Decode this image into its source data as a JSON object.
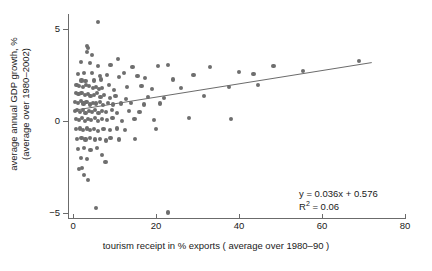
{
  "chart_data": {
    "type": "scatter",
    "title": "",
    "xlabel": "tourism receipt in % exports ( average over 1980–90 )",
    "ylabel_line1": "average annual GDP growth, %",
    "ylabel_line2": "(average over 1980–2002)",
    "xlim": [
      -1,
      80.5
    ],
    "ylim": [
      -5.9,
      5.8
    ],
    "xticks": [
      0,
      20,
      40,
      60,
      80
    ],
    "xtick_labels": [
      "0",
      "20",
      "40",
      "60",
      "80"
    ],
    "yticks": [
      5,
      0,
      -5
    ],
    "ytick_labels": [
      "5",
      "0",
      "−5"
    ],
    "grid": false,
    "legend": null,
    "marker_color": "#6e6e6e",
    "marker_size": 4.2,
    "axis_color": "#6b6b6b",
    "trendline": {
      "equation": "y = 0.036x + 0.576",
      "slope": 0.036,
      "intercept": 0.576,
      "r_squared": "R² = 0.06",
      "r_squared_value": 0.06,
      "color": "#6b6b6b",
      "x_start": 0.3,
      "x_end": 72.0
    },
    "annotation_lines": [
      "y = 0.036x + 0.576",
      "R2 = 0.06"
    ],
    "points": [
      [
        6.0,
        5.35
      ],
      [
        3.3,
        4.05
      ],
      [
        3.6,
        3.95
      ],
      [
        3.4,
        3.75
      ],
      [
        4.6,
        3.6
      ],
      [
        1.9,
        3.2
      ],
      [
        4.0,
        3.15
      ],
      [
        6.0,
        3.0
      ],
      [
        9.0,
        3.05
      ],
      [
        10.8,
        3.35
      ],
      [
        14.3,
        2.95
      ],
      [
        20.5,
        3.0
      ],
      [
        22.8,
        3.05
      ],
      [
        33.0,
        2.95
      ],
      [
        48.3,
        3.0
      ],
      [
        69.0,
        3.25
      ],
      [
        1.2,
        2.55
      ],
      [
        2.7,
        2.6
      ],
      [
        4.5,
        2.6
      ],
      [
        6.4,
        2.45
      ],
      [
        8.2,
        2.5
      ],
      [
        11.0,
        2.4
      ],
      [
        2.0,
        2.2
      ],
      [
        3.0,
        2.15
      ],
      [
        5.1,
        2.2
      ],
      [
        6.8,
        2.25
      ],
      [
        12.3,
        2.6
      ],
      [
        15.5,
        2.45
      ],
      [
        17.3,
        2.35
      ],
      [
        24.0,
        2.25
      ],
      [
        29.0,
        2.5
      ],
      [
        40.0,
        2.65
      ],
      [
        43.5,
        2.55
      ],
      [
        55.5,
        2.7
      ],
      [
        0.8,
        1.95
      ],
      [
        1.5,
        1.9
      ],
      [
        2.4,
        1.85
      ],
      [
        3.1,
        1.95
      ],
      [
        3.9,
        1.9
      ],
      [
        4.7,
        1.8
      ],
      [
        5.5,
        1.85
      ],
      [
        6.2,
        1.75
      ],
      [
        7.0,
        1.8
      ],
      [
        8.6,
        1.95
      ],
      [
        9.8,
        1.7
      ],
      [
        13.0,
        1.85
      ],
      [
        16.5,
        1.9
      ],
      [
        19.0,
        1.75
      ],
      [
        26.0,
        1.8
      ],
      [
        37.5,
        1.85
      ],
      [
        44.5,
        1.95
      ],
      [
        0.6,
        1.5
      ],
      [
        1.3,
        1.45
      ],
      [
        2.0,
        1.5
      ],
      [
        2.8,
        1.4
      ],
      [
        3.5,
        1.45
      ],
      [
        4.2,
        1.35
      ],
      [
        5.0,
        1.4
      ],
      [
        5.8,
        1.5
      ],
      [
        6.6,
        1.3
      ],
      [
        7.4,
        1.4
      ],
      [
        8.9,
        1.25
      ],
      [
        10.2,
        1.35
      ],
      [
        12.8,
        1.2
      ],
      [
        18.0,
        1.3
      ],
      [
        22.0,
        1.25
      ],
      [
        31.5,
        1.35
      ],
      [
        0.5,
        1.05
      ],
      [
        1.1,
        1.0
      ],
      [
        1.8,
        1.1
      ],
      [
        2.5,
        0.95
      ],
      [
        3.2,
        1.05
      ],
      [
        4.0,
        0.9
      ],
      [
        4.8,
        1.0
      ],
      [
        5.6,
        0.95
      ],
      [
        6.4,
        1.05
      ],
      [
        7.2,
        0.85
      ],
      [
        8.4,
        1.0
      ],
      [
        9.6,
        0.9
      ],
      [
        11.5,
        0.95
      ],
      [
        14.0,
        1.0
      ],
      [
        17.0,
        0.9
      ],
      [
        21.0,
        0.95
      ],
      [
        0.4,
        0.55
      ],
      [
        1.0,
        0.6
      ],
      [
        1.7,
        0.5
      ],
      [
        2.3,
        0.6
      ],
      [
        3.0,
        0.45
      ],
      [
        3.8,
        0.55
      ],
      [
        4.5,
        0.5
      ],
      [
        5.3,
        0.6
      ],
      [
        6.1,
        0.45
      ],
      [
        7.0,
        0.55
      ],
      [
        8.0,
        0.5
      ],
      [
        9.3,
        0.6
      ],
      [
        10.6,
        0.45
      ],
      [
        13.5,
        0.55
      ],
      [
        16.0,
        0.5
      ],
      [
        0.6,
        0.1
      ],
      [
        1.4,
        0.05
      ],
      [
        2.1,
        0.15
      ],
      [
        2.9,
        0.0
      ],
      [
        3.6,
        0.1
      ],
      [
        4.4,
        0.05
      ],
      [
        5.2,
        0.15
      ],
      [
        6.0,
        0.0
      ],
      [
        6.9,
        0.1
      ],
      [
        8.1,
        0.05
      ],
      [
        9.5,
        0.15
      ],
      [
        11.8,
        0.0
      ],
      [
        14.8,
        0.1
      ],
      [
        19.5,
        0.05
      ],
      [
        28.0,
        0.15
      ],
      [
        38.0,
        0.1
      ],
      [
        0.7,
        -0.45
      ],
      [
        1.6,
        -0.4
      ],
      [
        2.4,
        -0.5
      ],
      [
        3.3,
        -0.4
      ],
      [
        4.1,
        -0.5
      ],
      [
        5.0,
        -0.45
      ],
      [
        6.0,
        -0.55
      ],
      [
        7.3,
        -0.45
      ],
      [
        8.8,
        -0.5
      ],
      [
        10.5,
        -0.4
      ],
      [
        12.5,
        -0.5
      ],
      [
        20.0,
        -0.45
      ],
      [
        0.9,
        -0.95
      ],
      [
        2.0,
        -0.9
      ],
      [
        3.0,
        -1.0
      ],
      [
        4.0,
        -0.9
      ],
      [
        5.2,
        -1.0
      ],
      [
        6.5,
        -0.95
      ],
      [
        8.0,
        -1.05
      ],
      [
        9.0,
        -0.9
      ],
      [
        11.0,
        -1.0
      ],
      [
        15.0,
        -0.95
      ],
      [
        1.2,
        -1.5
      ],
      [
        2.6,
        -1.45
      ],
      [
        4.2,
        -1.55
      ],
      [
        5.8,
        -1.45
      ],
      [
        1.8,
        -2.0
      ],
      [
        3.4,
        -2.05
      ],
      [
        7.0,
        -1.85
      ],
      [
        7.8,
        -2.2
      ],
      [
        1.5,
        -2.6
      ],
      [
        2.2,
        -2.55
      ],
      [
        2.6,
        -2.9
      ],
      [
        3.5,
        -3.2
      ],
      [
        5.5,
        -4.7
      ],
      [
        22.8,
        -4.95
      ]
    ]
  }
}
